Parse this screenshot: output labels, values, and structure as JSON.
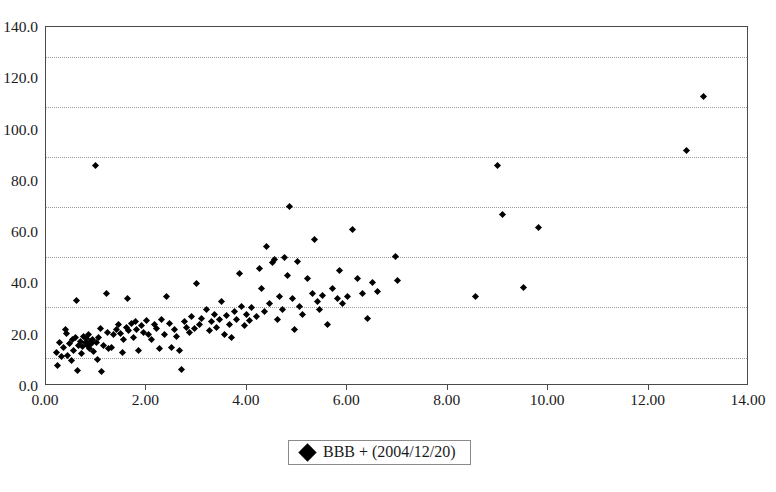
{
  "chart_data": {
    "type": "scatter",
    "title": "",
    "xlabel": "",
    "ylabel": "",
    "xlim": [
      0.0,
      14.0
    ],
    "ylim": [
      0.0,
      140.0
    ],
    "grid": true,
    "legend_position": "bottom-center",
    "xticks": [
      "0.00",
      "2.00",
      "4.00",
      "6.00",
      "8.00",
      "10.00",
      "12.00",
      "14.00"
    ],
    "xtick_values": [
      0.0,
      2.0,
      4.0,
      6.0,
      8.0,
      10.0,
      12.0,
      14.0
    ],
    "yticks": [
      "0.0",
      "20.0",
      "40.0",
      "60.0",
      "80.0",
      "100.0",
      "120.0",
      "140.0"
    ],
    "ytick_values": [
      0.0,
      20.0,
      40.0,
      60.0,
      80.0,
      100.0,
      120.0,
      140.0
    ],
    "gridline_values": [
      11.0,
      31.0,
      50.5,
      70.0,
      89.5,
      109.0,
      128.5
    ],
    "marker": "diamond",
    "marker_color": "#000000",
    "series": [
      {
        "name": "BBB + (2004/12/20)",
        "points": [
          [
            0.2,
            13.0
          ],
          [
            0.22,
            8.0
          ],
          [
            0.26,
            17.0
          ],
          [
            0.3,
            11.5
          ],
          [
            0.34,
            15.0
          ],
          [
            0.38,
            22.0
          ],
          [
            0.4,
            20.5
          ],
          [
            0.42,
            12.0
          ],
          [
            0.46,
            16.5
          ],
          [
            0.5,
            10.0
          ],
          [
            0.52,
            18.0
          ],
          [
            0.55,
            14.0
          ],
          [
            0.58,
            19.0
          ],
          [
            0.6,
            33.5
          ],
          [
            0.62,
            6.0
          ],
          [
            0.65,
            16.0
          ],
          [
            0.68,
            17.5
          ],
          [
            0.7,
            12.5
          ],
          [
            0.72,
            15.5
          ],
          [
            0.74,
            19.5
          ],
          [
            0.78,
            17.0
          ],
          [
            0.8,
            18.5
          ],
          [
            0.82,
            16.0
          ],
          [
            0.84,
            20.0
          ],
          [
            0.86,
            14.5
          ],
          [
            0.88,
            17.5
          ],
          [
            0.9,
            16.5
          ],
          [
            0.92,
            18.0
          ],
          [
            0.95,
            13.5
          ],
          [
            0.98,
            86.0
          ],
          [
            1.0,
            17.0
          ],
          [
            1.02,
            10.5
          ],
          [
            1.05,
            19.0
          ],
          [
            1.08,
            22.5
          ],
          [
            1.1,
            5.5
          ],
          [
            1.15,
            16.0
          ],
          [
            1.2,
            36.0
          ],
          [
            1.22,
            21.0
          ],
          [
            1.25,
            14.5
          ],
          [
            1.3,
            15.0
          ],
          [
            1.35,
            20.0
          ],
          [
            1.4,
            22.0
          ],
          [
            1.45,
            24.0
          ],
          [
            1.48,
            20.5
          ],
          [
            1.52,
            13.0
          ],
          [
            1.55,
            18.0
          ],
          [
            1.6,
            23.0
          ],
          [
            1.62,
            34.0
          ],
          [
            1.65,
            21.5
          ],
          [
            1.7,
            24.5
          ],
          [
            1.75,
            19.0
          ],
          [
            1.78,
            25.0
          ],
          [
            1.8,
            22.0
          ],
          [
            1.85,
            14.0
          ],
          [
            1.9,
            23.5
          ],
          [
            1.95,
            21.0
          ],
          [
            2.0,
            25.5
          ],
          [
            2.05,
            20.0
          ],
          [
            2.1,
            18.0
          ],
          [
            2.15,
            24.0
          ],
          [
            2.2,
            22.5
          ],
          [
            2.25,
            14.5
          ],
          [
            2.3,
            26.0
          ],
          [
            2.35,
            20.0
          ],
          [
            2.4,
            35.0
          ],
          [
            2.45,
            24.5
          ],
          [
            2.5,
            15.0
          ],
          [
            2.55,
            22.0
          ],
          [
            2.6,
            19.5
          ],
          [
            2.65,
            14.0
          ],
          [
            2.7,
            6.5
          ],
          [
            2.75,
            25.0
          ],
          [
            2.8,
            23.0
          ],
          [
            2.85,
            21.0
          ],
          [
            2.9,
            27.0
          ],
          [
            2.95,
            22.5
          ],
          [
            3.0,
            40.0
          ],
          [
            3.05,
            24.0
          ],
          [
            3.1,
            26.5
          ],
          [
            3.2,
            30.0
          ],
          [
            3.25,
            21.5
          ],
          [
            3.3,
            25.0
          ],
          [
            3.35,
            28.0
          ],
          [
            3.4,
            23.0
          ],
          [
            3.45,
            26.0
          ],
          [
            3.5,
            33.0
          ],
          [
            3.55,
            20.0
          ],
          [
            3.6,
            27.5
          ],
          [
            3.65,
            24.0
          ],
          [
            3.7,
            19.0
          ],
          [
            3.75,
            29.0
          ],
          [
            3.8,
            26.0
          ],
          [
            3.85,
            44.0
          ],
          [
            3.9,
            31.0
          ],
          [
            3.95,
            23.5
          ],
          [
            4.0,
            28.0
          ],
          [
            4.05,
            25.5
          ],
          [
            4.1,
            30.5
          ],
          [
            4.2,
            27.0
          ],
          [
            4.25,
            46.0
          ],
          [
            4.3,
            38.0
          ],
          [
            4.35,
            29.0
          ],
          [
            4.4,
            54.5
          ],
          [
            4.45,
            32.0
          ],
          [
            4.5,
            48.0
          ],
          [
            4.55,
            49.5
          ],
          [
            4.6,
            26.0
          ],
          [
            4.65,
            35.0
          ],
          [
            4.7,
            30.0
          ],
          [
            4.75,
            50.0
          ],
          [
            4.8,
            43.0
          ],
          [
            4.85,
            70.0
          ],
          [
            4.9,
            34.0
          ],
          [
            4.95,
            22.0
          ],
          [
            5.0,
            48.5
          ],
          [
            5.05,
            31.0
          ],
          [
            5.1,
            28.0
          ],
          [
            5.2,
            42.0
          ],
          [
            5.3,
            36.0
          ],
          [
            5.35,
            57.0
          ],
          [
            5.4,
            33.0
          ],
          [
            5.45,
            30.0
          ],
          [
            5.5,
            35.5
          ],
          [
            5.6,
            24.0
          ],
          [
            5.7,
            38.0
          ],
          [
            5.8,
            34.0
          ],
          [
            5.85,
            45.0
          ],
          [
            5.9,
            32.0
          ],
          [
            6.0,
            35.0
          ],
          [
            6.1,
            61.0
          ],
          [
            6.2,
            42.0
          ],
          [
            6.3,
            36.0
          ],
          [
            6.4,
            26.5
          ],
          [
            6.5,
            40.5
          ],
          [
            6.6,
            37.0
          ],
          [
            6.95,
            50.5
          ],
          [
            7.0,
            41.0
          ],
          [
            8.55,
            35.0
          ],
          [
            9.0,
            86.0
          ],
          [
            9.1,
            67.0
          ],
          [
            9.5,
            38.5
          ],
          [
            9.8,
            62.0
          ],
          [
            12.75,
            92.0
          ],
          [
            13.1,
            113.0
          ]
        ]
      }
    ]
  },
  "legend": {
    "marker_name": "diamond-marker",
    "label": "BBB + (2004/12/20)"
  }
}
